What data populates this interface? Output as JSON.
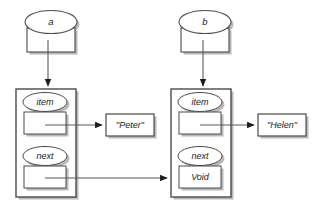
{
  "diagram": {
    "type": "linked-list",
    "colors": {
      "background": "#ffffff",
      "stroke": "#4a4a4a",
      "shadow": "#b9b9b9",
      "text": "#1a1a1a",
      "connector": "#5a5a5a",
      "arrowhead": "#1d1d1d"
    },
    "variables": [
      {
        "id": "var-a",
        "label": "a",
        "slot_value": ""
      },
      {
        "id": "var-b",
        "label": "b",
        "slot_value": ""
      }
    ],
    "nodes": [
      {
        "id": "node-1",
        "fields": [
          {
            "name": "item",
            "label": "item",
            "slot_value": ""
          },
          {
            "name": "next",
            "label": "next",
            "slot_value": ""
          }
        ]
      },
      {
        "id": "node-2",
        "fields": [
          {
            "name": "item",
            "label": "item",
            "slot_value": ""
          },
          {
            "name": "next",
            "label": "next",
            "slot_value": "Void"
          }
        ]
      }
    ],
    "values": [
      {
        "id": "value-peter",
        "label": "\"Peter\""
      },
      {
        "id": "value-helen",
        "label": "\"Helen\""
      }
    ],
    "edges": [
      {
        "id": "edge-a-to-node1",
        "from": "var-a",
        "to": "node-1",
        "label": ""
      },
      {
        "id": "edge-b-to-node2",
        "from": "var-b",
        "to": "node-2",
        "label": ""
      },
      {
        "id": "edge-node1-item-to-peter",
        "from": "node-1.item",
        "to": "value-peter",
        "label": ""
      },
      {
        "id": "edge-node1-next-to-node2",
        "from": "node-1.next",
        "to": "node-2",
        "label": ""
      },
      {
        "id": "edge-node2-item-to-helen",
        "from": "node-2.item",
        "to": "value-helen",
        "label": ""
      }
    ]
  }
}
